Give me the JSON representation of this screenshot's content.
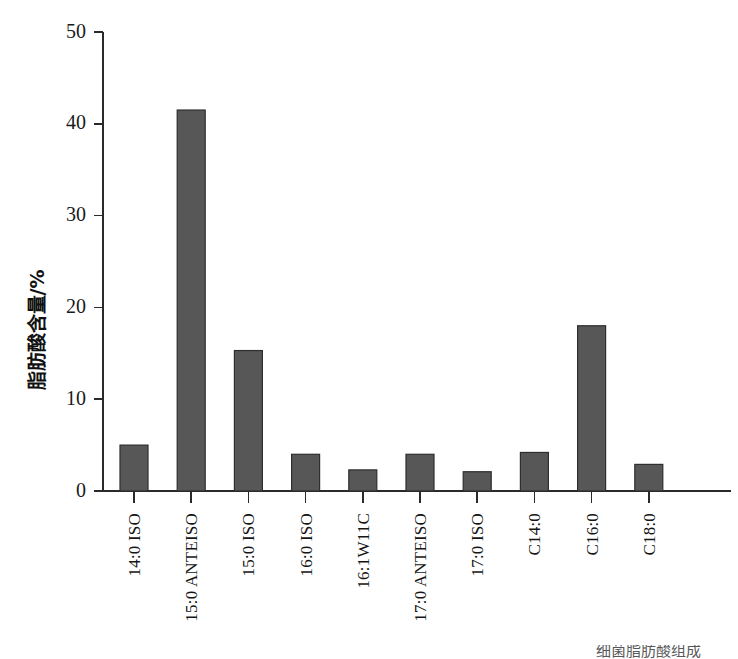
{
  "chart_data": {
    "type": "bar",
    "title": "",
    "subtitle": "",
    "xlabel": "",
    "ylabel": "脂肪酸含量/%",
    "ylim": [
      0,
      50
    ],
    "ytick_values": [
      0,
      10,
      20,
      30,
      40,
      50
    ],
    "ytick_labels": [
      "0",
      "10",
      "20",
      "30",
      "40",
      "50"
    ],
    "grid": false,
    "legend": null,
    "legend_position": "none",
    "bar_color": "#575757",
    "bar_edge_color": "#2e2e2e",
    "axis_color": "#2a2a2a",
    "categories": [
      "14:0 ISO",
      "15:0 ANTEISO",
      "15:0 ISO",
      "16:0 ISO",
      "16:1W11C",
      "17:0 ANTEISO",
      "17:0 ISO",
      "C14:0",
      "C16:0",
      "C18:0"
    ],
    "values": [
      5.0,
      41.5,
      15.3,
      4.0,
      2.3,
      4.0,
      2.1,
      4.2,
      18.0,
      2.9
    ]
  },
  "footer": {
    "clipped_text": "细菌脂肪酸组成"
  }
}
